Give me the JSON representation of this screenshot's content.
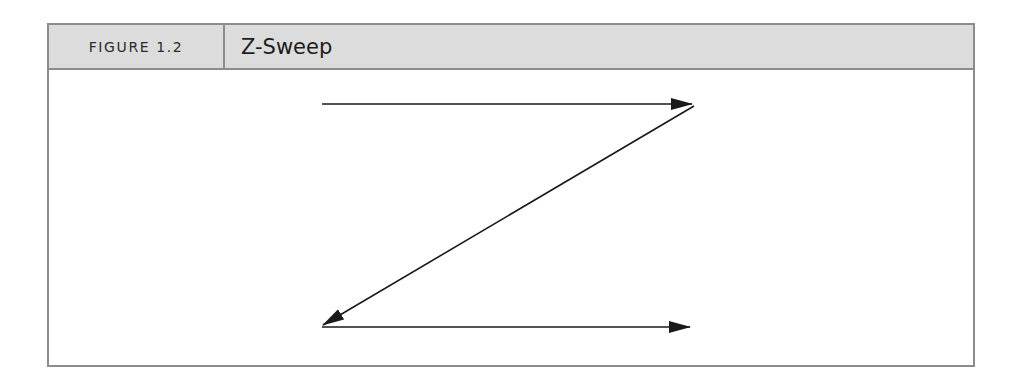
{
  "figure": {
    "label": "FIGURE 1.2",
    "title": "Z-Sweep"
  },
  "diagram": {
    "type": "z-pattern",
    "colors": {
      "border": "#8c8c8c",
      "header_bg": "#dcdcdc",
      "stroke": "#1a1a1a"
    },
    "arrows": [
      {
        "name": "top-arrow",
        "from": [
          322,
          104
        ],
        "to": [
          692,
          104
        ],
        "direction": "right"
      },
      {
        "name": "diagonal-arrow",
        "from": [
          694,
          106
        ],
        "to": [
          323,
          325
        ],
        "direction": "down-left"
      },
      {
        "name": "bottom-arrow",
        "from": [
          322,
          327
        ],
        "to": [
          690,
          327
        ],
        "direction": "right"
      }
    ]
  }
}
